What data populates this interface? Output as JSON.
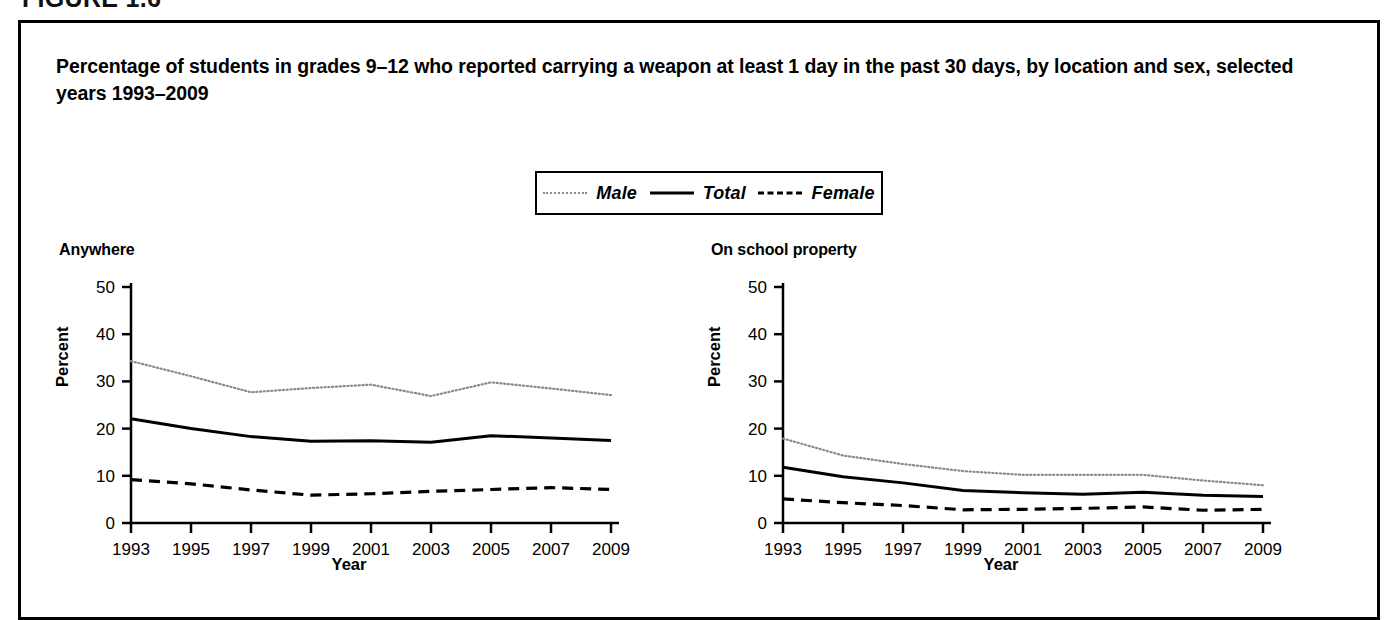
{
  "figure": {
    "label": "FIGURE 1.6",
    "title": "Percentage of students in grades 9–12 who reported carrying a weapon at least 1 day in the past 30 days, by location and sex, selected years 1993–2009"
  },
  "legend": {
    "position": "top-center",
    "entries": [
      {
        "label": "Male",
        "style": "dotted",
        "color": "#8a8a8a"
      },
      {
        "label": "Total",
        "style": "solid",
        "color": "#000000"
      },
      {
        "label": "Female",
        "style": "dashed",
        "color": "#000000"
      }
    ]
  },
  "chart_data": [
    {
      "type": "line",
      "title": "Anywhere",
      "xlabel": "Year",
      "ylabel": "Percent",
      "ylim": [
        0,
        50
      ],
      "yticks": [
        0,
        10,
        20,
        30,
        40,
        50
      ],
      "xlim": [
        1993,
        2009
      ],
      "xticks": [
        1993,
        1995,
        1997,
        1999,
        2001,
        2003,
        2005,
        2007,
        2009
      ],
      "x": [
        1993,
        1995,
        1997,
        1999,
        2001,
        2003,
        2005,
        2007,
        2009
      ],
      "grid": false,
      "series": [
        {
          "name": "Male",
          "style": "dotted",
          "color": "#8a8a8a",
          "values": [
            34.3,
            31.1,
            27.7,
            28.6,
            29.3,
            26.9,
            29.8,
            28.5,
            27.1
          ]
        },
        {
          "name": "Total",
          "style": "solid",
          "color": "#000000",
          "values": [
            22.1,
            20.0,
            18.3,
            17.3,
            17.4,
            17.1,
            18.5,
            18.0,
            17.5
          ]
        },
        {
          "name": "Female",
          "style": "dashed",
          "color": "#000000",
          "values": [
            9.2,
            8.3,
            7.0,
            5.9,
            6.2,
            6.7,
            7.1,
            7.5,
            7.1
          ]
        }
      ]
    },
    {
      "type": "line",
      "title": "On school property",
      "xlabel": "Year",
      "ylabel": "Percent",
      "ylim": [
        0,
        50
      ],
      "yticks": [
        0,
        10,
        20,
        30,
        40,
        50
      ],
      "xlim": [
        1993,
        2009
      ],
      "xticks": [
        1993,
        1995,
        1997,
        1999,
        2001,
        2003,
        2005,
        2007,
        2009
      ],
      "x": [
        1993,
        1995,
        1997,
        1999,
        2001,
        2003,
        2005,
        2007,
        2009
      ],
      "grid": false,
      "series": [
        {
          "name": "Male",
          "style": "dotted",
          "color": "#8a8a8a",
          "values": [
            17.9,
            14.3,
            12.5,
            11.0,
            10.2,
            10.2,
            10.2,
            9.0,
            8.0
          ]
        },
        {
          "name": "Total",
          "style": "solid",
          "color": "#000000",
          "values": [
            11.8,
            9.8,
            8.5,
            6.9,
            6.4,
            6.1,
            6.5,
            5.9,
            5.6
          ]
        },
        {
          "name": "Female",
          "style": "dashed",
          "color": "#000000",
          "values": [
            5.1,
            4.3,
            3.7,
            2.8,
            2.9,
            3.1,
            3.4,
            2.7,
            2.9
          ]
        }
      ]
    }
  ]
}
